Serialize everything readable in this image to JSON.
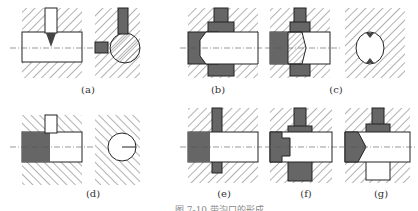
{
  "figure": {
    "labels": {
      "a": "(a)",
      "b": "(b)",
      "c": "(c)",
      "d": "(d)",
      "e": "(e)",
      "f": "(f)",
      "g": "(g)"
    },
    "caption": "图 7-10  带沟口的形成"
  },
  "colors": {
    "dark_fill": "#555555",
    "hatch": "#666666",
    "line": "#222222"
  }
}
